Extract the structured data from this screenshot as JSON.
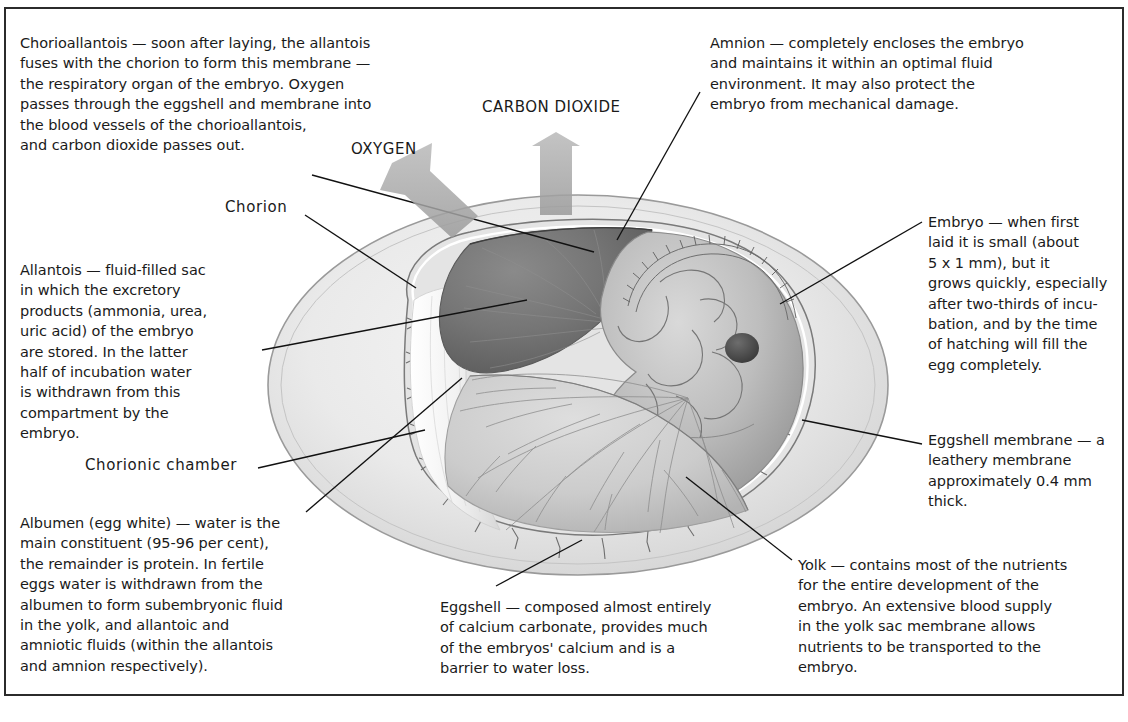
{
  "figure": {
    "type": "anatomical-diagram",
    "palette": {
      "ink": "#1a1a1a",
      "frame_rule": "#2b2b2b",
      "shell_outline": "#8e8e8e",
      "albumen_fill": "#ebebeb",
      "allantois_dark": "#6f6f6f",
      "yolk_mid": "#c6c6c6",
      "arrow_gray": "#a8a8a8",
      "embryo_mid": "#b4b4b4",
      "eye_dark": "#4a4a4a"
    }
  },
  "gas_exchange": {
    "oxygen_label": "OXYGEN",
    "carbon_dioxide_label": "CARBON DIOXIDE",
    "oxygen_direction": "into the egg (down-right)",
    "carbon_dioxide_direction": "out of the egg (up)"
  },
  "short_callouts": {
    "chorion": "Chorion",
    "chorionic_chamber": "Chorionic chamber"
  },
  "notes": {
    "chorioallantois": "Chorioallantois — soon after laying, the allantois\nfuses with the chorion to form this membrane —\nthe respiratory organ of the embryo. Oxygen\npasses through the eggshell and membrane into\nthe blood vessels of the chorioallantois,\nand carbon dioxide passes out.",
    "amnion": "Amnion — completely encloses the embryo\nand maintains it within an optimal fluid\nenvironment. It may also protect the\nembryo from mechanical damage.",
    "embryo": "Embryo — when first\nlaid it is small (about\n5 x 1 mm), but it\ngrows quickly, especially\nafter two-thirds of incu-\nbation, and by the time\nof hatching will fill the\negg completely.",
    "allantois": "Allantois — fluid-filled sac\nin which the excretory\nproducts (ammonia, urea,\nuric acid) of the embryo\nare stored. In the latter\nhalf of incubation water\nis withdrawn from this\ncompartment by the\nembryo.",
    "eggshell_membrane": "Eggshell membrane — a\nleathery membrane\napproximately 0.4 mm\nthick.",
    "albumen": "Albumen (egg white) — water is the\nmain constituent (95-96 per cent),\nthe remainder is protein. In fertile\neggs water is withdrawn from the\nalbumen to form subembryonic fluid\nin the yolk, and allantoic and\namniotic fluids (within the allantois\nand amnion respectively).",
    "eggshell": "Eggshell — composed almost entirely\nof calcium carbonate, provides much\nof the embryos' calcium and is a\nbarrier to water loss.",
    "yolk": "Yolk — contains most of the nutrients\nfor the entire development of the\nembryo. An extensive blood supply\nin the yolk sac membrane allows\nnutrients to be transported to the\nembryo."
  }
}
